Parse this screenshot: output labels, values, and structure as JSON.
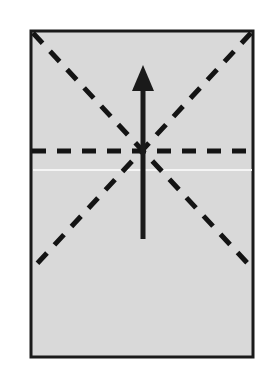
{
  "figure": {
    "kind": "origami-fold-diagram",
    "canvas": {
      "width": 272,
      "height": 378,
      "background": "#ffffff"
    },
    "colors": {
      "paper_fill": "#d9d9d9",
      "paper_border": "#1a1a1a",
      "crease_line": "#141414",
      "arrow": "#1a1a1a",
      "faint_line": "#f2f2f2",
      "background": "#ffffff"
    },
    "paper": {
      "label": "paper-sheet",
      "x": 31,
      "y": 31,
      "width": 222,
      "height": 326,
      "border_width": 3,
      "fill": "#d9d9d9",
      "stroke": "#1a1a1a"
    },
    "center_point": {
      "x": 143,
      "y": 151
    },
    "creases": [
      {
        "name": "diagonal-crease-top-left-to-bottom-right",
        "type": "dashed",
        "x1": 33,
        "y1": 33,
        "x2": 252,
        "y2": 268,
        "stroke_width": 5,
        "dash": "14 11"
      },
      {
        "name": "diagonal-crease-top-right-to-bottom-left",
        "type": "dashed",
        "x1": 251,
        "y1": 33,
        "x2": 33,
        "y2": 268,
        "stroke_width": 5,
        "dash": "14 11"
      },
      {
        "name": "horizontal-crease",
        "type": "dashed",
        "x1": 32,
        "y1": 151,
        "x2": 253,
        "y2": 151,
        "stroke_width": 5,
        "dash": "14 11"
      }
    ],
    "faint_line": {
      "name": "paper-edge-highlight",
      "x1": 33,
      "y1": 170,
      "x2": 252,
      "y2": 170,
      "stroke_width": 2,
      "stroke": "#f5f5f5"
    },
    "arrow": {
      "name": "fold-direction-arrow",
      "direction": "up",
      "shaft_x": 143,
      "tail_y": 239,
      "tip_y": 65,
      "shaft_width": 5,
      "head_width": 22,
      "head_height": 26,
      "fill": "#1a1a1a"
    }
  }
}
